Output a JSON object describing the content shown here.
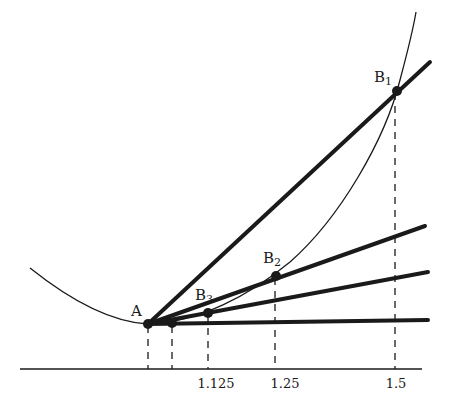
{
  "figure": {
    "colors": {
      "ink": "#1a1a1a",
      "background": "#ffffff"
    },
    "points": {
      "A": {
        "label": "A",
        "sub": ""
      },
      "B1": {
        "label": "B",
        "sub": "1"
      },
      "B2": {
        "label": "B",
        "sub": "2"
      },
      "B3": {
        "label": "B",
        "sub": "3"
      }
    },
    "x_axis": {
      "tick_labels": [
        "1.125",
        "1.25",
        "1.5"
      ]
    },
    "lines": [
      {
        "name": "secant-A-B1"
      },
      {
        "name": "secant-A-B2"
      },
      {
        "name": "secant-A-B3"
      },
      {
        "name": "tangent-at-A"
      }
    ]
  }
}
